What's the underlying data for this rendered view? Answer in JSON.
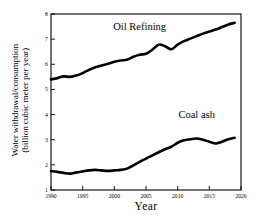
{
  "chart_data": {
    "type": "line",
    "title": "",
    "xlabel": "Year",
    "ylabel_line1": "Water withdrawal/consumption",
    "ylabel_line2": "(billion cubic meter per year)",
    "xlim": [
      1990,
      2020
    ],
    "ylim": [
      1,
      8
    ],
    "xticks": [
      1990,
      1995,
      2000,
      2005,
      2010,
      2015,
      2020
    ],
    "yticks": [
      1,
      2,
      3,
      4,
      5,
      6,
      7,
      8
    ],
    "grid": false,
    "legend_position": "inline-annotations",
    "line_color": "#000000",
    "background_color": "#ffffff",
    "x": [
      1990,
      1991,
      1992,
      1993,
      1994,
      1995,
      1996,
      1997,
      1998,
      1999,
      2000,
      2001,
      2002,
      2003,
      2004,
      2005,
      2006,
      2007,
      2008,
      2009,
      2010,
      2011,
      2012,
      2013,
      2014,
      2015,
      2016,
      2017,
      2018,
      2019
    ],
    "series": [
      {
        "name": "Oil Refining",
        "values": [
          5.4,
          5.45,
          5.52,
          5.5,
          5.55,
          5.65,
          5.78,
          5.88,
          5.95,
          6.02,
          6.1,
          6.15,
          6.18,
          6.3,
          6.38,
          6.42,
          6.58,
          6.78,
          6.72,
          6.6,
          6.78,
          6.92,
          7.02,
          7.12,
          7.22,
          7.3,
          7.38,
          7.48,
          7.58,
          7.65
        ]
      },
      {
        "name": "Coal ash",
        "values": [
          1.75,
          1.72,
          1.68,
          1.65,
          1.7,
          1.74,
          1.78,
          1.8,
          1.78,
          1.76,
          1.78,
          1.8,
          1.85,
          1.98,
          2.12,
          2.25,
          2.38,
          2.5,
          2.62,
          2.72,
          2.88,
          2.98,
          3.02,
          3.05,
          3.0,
          2.92,
          2.85,
          2.92,
          3.02,
          3.08
        ]
      }
    ],
    "annotations": [
      {
        "text": "Oil Refining",
        "x": 2004,
        "y": 7.35
      },
      {
        "text": "Coal ash",
        "x": 2013,
        "y": 3.85
      }
    ]
  }
}
